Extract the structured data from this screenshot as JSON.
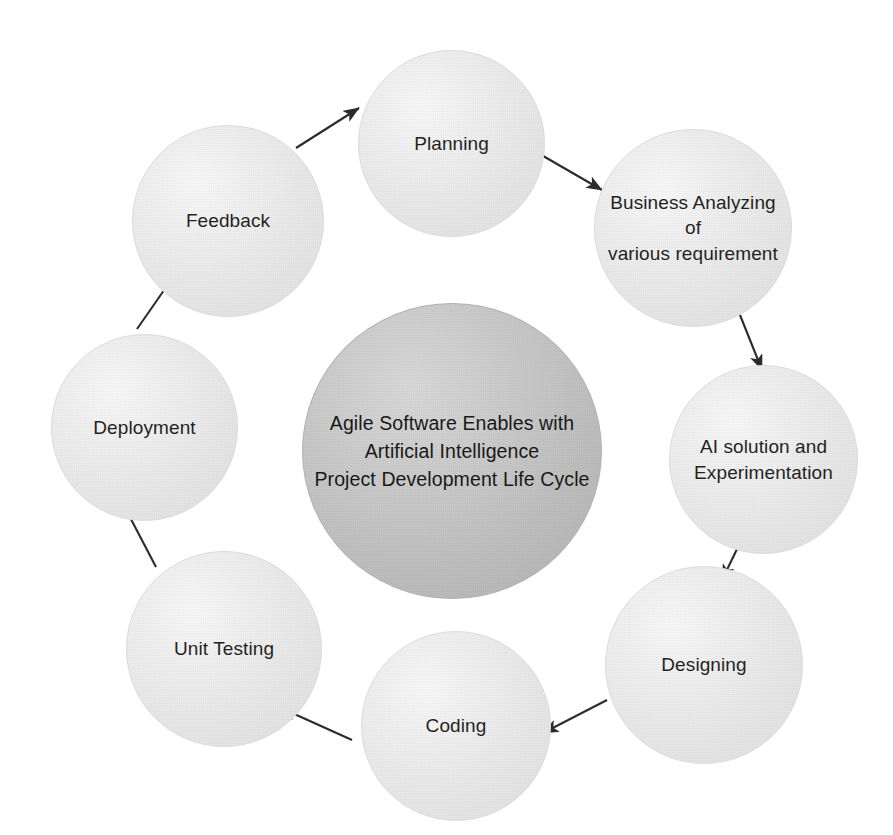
{
  "diagram": {
    "type": "cycle-diagram",
    "direction": "clockwise",
    "background_color": "#ffffff",
    "node_fill_color": "#e8e8e8",
    "center_fill_color": "#bfbfbf",
    "text_color": "#1f1f1f",
    "arrow_color": "#2b2b2b"
  },
  "center": {
    "label": "Agile Software Enables with\nArtificial Intelligence\nProject Development Life Cycle",
    "line1": "Agile Software Enables with",
    "line2": "Artificial Intelligence",
    "line3": "Project Development Life Cycle"
  },
  "nodes": [
    {
      "id": "planning",
      "label": "Planning"
    },
    {
      "id": "business",
      "label": "Business Analyzing of\nvarious requirement"
    },
    {
      "id": "ai",
      "label": "AI solution and\nExperimentation"
    },
    {
      "id": "designing",
      "label": "Designing"
    },
    {
      "id": "coding",
      "label": "Coding"
    },
    {
      "id": "testing",
      "label": "Unit  Testing"
    },
    {
      "id": "deployment",
      "label": "Deployment"
    },
    {
      "id": "feedback",
      "label": "Feedback"
    }
  ],
  "arrows": [
    {
      "id": "feedback-to-planning",
      "from": "Feedback",
      "to": "Planning"
    },
    {
      "id": "planning-to-business",
      "from": "Planning",
      "to": "Business Analyzing of various requirement"
    },
    {
      "id": "business-to-ai",
      "from": "Business Analyzing of various requirement",
      "to": "AI solution and Experimentation"
    },
    {
      "id": "ai-to-designing",
      "from": "AI solution and Experimentation",
      "to": "Designing"
    },
    {
      "id": "designing-to-coding",
      "from": "Designing",
      "to": "Coding"
    },
    {
      "id": "coding-to-testing",
      "from": "Coding",
      "to": "Unit  Testing"
    },
    {
      "id": "testing-to-deployment",
      "from": "Unit  Testing",
      "to": "Deployment"
    },
    {
      "id": "deployment-to-feedback",
      "from": "Deployment",
      "to": "Feedback"
    }
  ]
}
